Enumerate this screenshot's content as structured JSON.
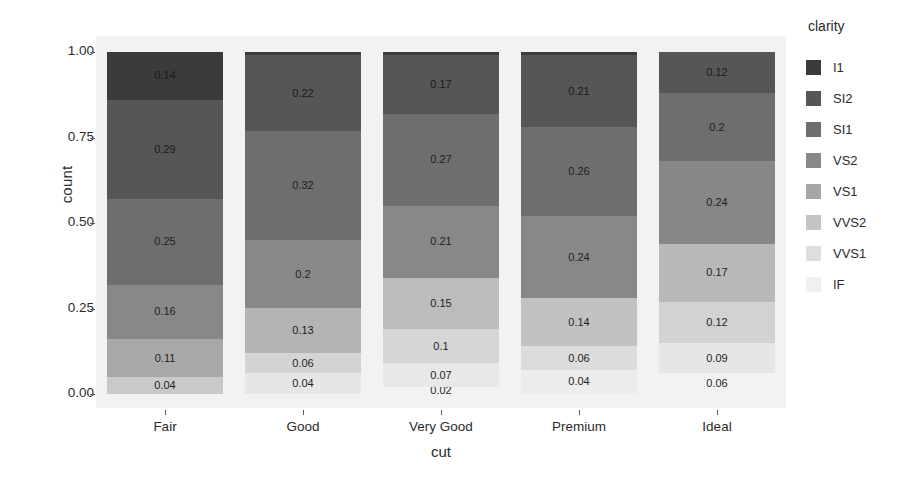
{
  "chart_data": {
    "type": "bar",
    "subtype": "stacked-100-percent",
    "title": "",
    "xlabel": "cut",
    "ylabel": "count",
    "categories": [
      "Fair",
      "Good",
      "Very Good",
      "Premium",
      "Ideal"
    ],
    "legend_title": "clarity",
    "legend_position": "right",
    "grid": false,
    "ylim": [
      0.0,
      1.0
    ],
    "ytick_labels": [
      "0.00",
      "0.25",
      "0.50",
      "0.75",
      "1.00"
    ],
    "ytick_values": [
      0.0,
      0.25,
      0.5,
      0.75,
      1.0
    ],
    "panel_background": "#f2f2f2",
    "stack_order_top_to_bottom": [
      "I1",
      "SI2",
      "SI1",
      "VS2",
      "VS1",
      "VVS2",
      "VVS1",
      "IF"
    ],
    "series": [
      {
        "name": "I1",
        "color": "#3b3b3b",
        "values": [
          0.14,
          0.01,
          0.01,
          0.01,
          0.0
        ]
      },
      {
        "name": "SI2",
        "color": "#565656",
        "values": [
          0.29,
          0.22,
          0.17,
          0.21,
          0.12
        ]
      },
      {
        "name": "SI1",
        "color": "#6e6e6e",
        "values": [
          0.25,
          0.32,
          0.27,
          0.26,
          0.2
        ]
      },
      {
        "name": "VS2",
        "color": "#888888",
        "values": [
          0.16,
          0.2,
          0.21,
          0.24,
          0.24
        ]
      },
      {
        "name": "VS1",
        "color": "#a6a6a6",
        "values": [
          0.11,
          0.13,
          0.15,
          0.14,
          0.17
        ]
      },
      {
        "name": "VVS2",
        "color": "#c4c4c4",
        "values": [
          0.04,
          0.06,
          0.1,
          0.06,
          0.12
        ]
      },
      {
        "name": "VVS1",
        "color": "#dedede",
        "values": [
          0.0,
          0.04,
          0.07,
          0.04,
          0.09
        ]
      },
      {
        "name": "IF",
        "color": "#f0f0f0",
        "values": [
          0.0,
          0.0,
          0.02,
          0.0,
          0.06
        ]
      }
    ],
    "bar_labels": {
      "Fair": [
        "0.14",
        "0.29",
        "0.25",
        "0.16",
        "0.11",
        "0.04"
      ],
      "Good": [
        "0.22",
        "0.32",
        "0.2",
        "0.13",
        "0.06",
        "0.04"
      ],
      "Very Good": [
        "0.17",
        "0.27",
        "0.21",
        "0.15",
        "0.1",
        "0.07",
        "0.02"
      ],
      "Premium": [
        "0.21",
        "0.26",
        "0.24",
        "0.14",
        "0.06",
        "0.04"
      ],
      "Ideal": [
        "0.12",
        "0.2",
        "0.24",
        "0.17",
        "0.12",
        "0.09",
        "0.06"
      ]
    }
  },
  "axes": {
    "y_title": "count",
    "x_title": "cut",
    "y_ticks": [
      {
        "label": "1.00",
        "value": 1.0
      },
      {
        "label": "0.75",
        "value": 0.75
      },
      {
        "label": "0.50",
        "value": 0.5
      },
      {
        "label": "0.25",
        "value": 0.25
      },
      {
        "label": "0.00",
        "value": 0.0
      }
    ],
    "x_ticks": [
      "Fair",
      "Good",
      "Very Good",
      "Premium",
      "Ideal"
    ]
  },
  "legend": {
    "title": "clarity",
    "items": [
      {
        "label": "I1",
        "color": "#3b3b3b"
      },
      {
        "label": "SI2",
        "color": "#565656"
      },
      {
        "label": "SI1",
        "color": "#6e6e6e"
      },
      {
        "label": "VS2",
        "color": "#888888"
      },
      {
        "label": "VS1",
        "color": "#a6a6a6"
      },
      {
        "label": "VVS2",
        "color": "#c4c4c4"
      },
      {
        "label": "VVS1",
        "color": "#dedede"
      },
      {
        "label": "IF",
        "color": "#f0f0f0"
      }
    ]
  },
  "bars": [
    {
      "category": "Fair",
      "segments": [
        {
          "clarity": "I1",
          "value": 0.14,
          "label": "0.14",
          "color": "#3b3b3b",
          "dark": true
        },
        {
          "clarity": "SI2",
          "value": 0.29,
          "label": "0.29",
          "color": "#565656",
          "dark": true
        },
        {
          "clarity": "SI1",
          "value": 0.25,
          "label": "0.25",
          "color": "#6e6e6e",
          "dark": false
        },
        {
          "clarity": "VS2",
          "value": 0.16,
          "label": "0.16",
          "color": "#888888",
          "dark": false
        },
        {
          "clarity": "VS1",
          "value": 0.11,
          "label": "0.11",
          "color": "#a8a8a8",
          "dark": false
        },
        {
          "clarity": "VVS2",
          "value": 0.05,
          "label": "0.04",
          "color": "#c9c9c9",
          "dark": false
        }
      ]
    },
    {
      "category": "Good",
      "segments": [
        {
          "clarity": "I1",
          "value": 0.01,
          "label": "",
          "color": "#3b3b3b",
          "dark": true
        },
        {
          "clarity": "SI2",
          "value": 0.22,
          "label": "0.22",
          "color": "#565656",
          "dark": true
        },
        {
          "clarity": "SI1",
          "value": 0.32,
          "label": "0.32",
          "color": "#6e6e6e",
          "dark": false
        },
        {
          "clarity": "VS2",
          "value": 0.2,
          "label": "0.2",
          "color": "#888888",
          "dark": false
        },
        {
          "clarity": "VS1",
          "value": 0.13,
          "label": "0.13",
          "color": "#b4b4b4",
          "dark": false
        },
        {
          "clarity": "VVS2",
          "value": 0.06,
          "label": "0.06",
          "color": "#d4d4d4",
          "dark": false
        },
        {
          "clarity": "VVS1",
          "value": 0.06,
          "label": "0.04",
          "color": "#e6e6e6",
          "dark": false
        }
      ]
    },
    {
      "category": "Very Good",
      "segments": [
        {
          "clarity": "I1",
          "value": 0.01,
          "label": "",
          "color": "#3b3b3b",
          "dark": true
        },
        {
          "clarity": "SI2",
          "value": 0.17,
          "label": "0.17",
          "color": "#565656",
          "dark": true
        },
        {
          "clarity": "SI1",
          "value": 0.27,
          "label": "0.27",
          "color": "#6e6e6e",
          "dark": false
        },
        {
          "clarity": "VS2",
          "value": 0.21,
          "label": "0.21",
          "color": "#888888",
          "dark": false
        },
        {
          "clarity": "VS1",
          "value": 0.15,
          "label": "0.15",
          "color": "#bcbcbc",
          "dark": false
        },
        {
          "clarity": "VVS2",
          "value": 0.1,
          "label": "0.1",
          "color": "#d6d6d6",
          "dark": false
        },
        {
          "clarity": "VVS1",
          "value": 0.07,
          "label": "0.07",
          "color": "#e8e8e8",
          "dark": false
        },
        {
          "clarity": "IF",
          "value": 0.02,
          "label": "0.02",
          "color": "#f2f2f2",
          "dark": false
        }
      ]
    },
    {
      "category": "Premium",
      "segments": [
        {
          "clarity": "I1",
          "value": 0.01,
          "label": "",
          "color": "#3b3b3b",
          "dark": true
        },
        {
          "clarity": "SI2",
          "value": 0.21,
          "label": "0.21",
          "color": "#565656",
          "dark": true
        },
        {
          "clarity": "SI1",
          "value": 0.26,
          "label": "0.26",
          "color": "#6e6e6e",
          "dark": false
        },
        {
          "clarity": "VS2",
          "value": 0.24,
          "label": "0.24",
          "color": "#888888",
          "dark": false
        },
        {
          "clarity": "VS1",
          "value": 0.14,
          "label": "0.14",
          "color": "#c2c2c2",
          "dark": false
        },
        {
          "clarity": "VVS2",
          "value": 0.07,
          "label": "0.06",
          "color": "#dcdcdc",
          "dark": false
        },
        {
          "clarity": "VVS1",
          "value": 0.07,
          "label": "0.04",
          "color": "#ececec",
          "dark": false
        }
      ]
    },
    {
      "category": "Ideal",
      "segments": [
        {
          "clarity": "SI2",
          "value": 0.12,
          "label": "0.12",
          "color": "#565656",
          "dark": true
        },
        {
          "clarity": "SI1",
          "value": 0.2,
          "label": "0.2",
          "color": "#6e6e6e",
          "dark": false
        },
        {
          "clarity": "VS2",
          "value": 0.24,
          "label": "0.24",
          "color": "#878787",
          "dark": false
        },
        {
          "clarity": "VS1",
          "value": 0.17,
          "label": "0.17",
          "color": "#b8b8b8",
          "dark": false
        },
        {
          "clarity": "VVS2",
          "value": 0.12,
          "label": "0.12",
          "color": "#d2d2d2",
          "dark": false
        },
        {
          "clarity": "VVS1",
          "value": 0.09,
          "label": "0.09",
          "color": "#e6e6e6",
          "dark": false
        },
        {
          "clarity": "IF",
          "value": 0.06,
          "label": "0.06",
          "color": "#f2f2f2",
          "dark": false
        }
      ]
    }
  ]
}
